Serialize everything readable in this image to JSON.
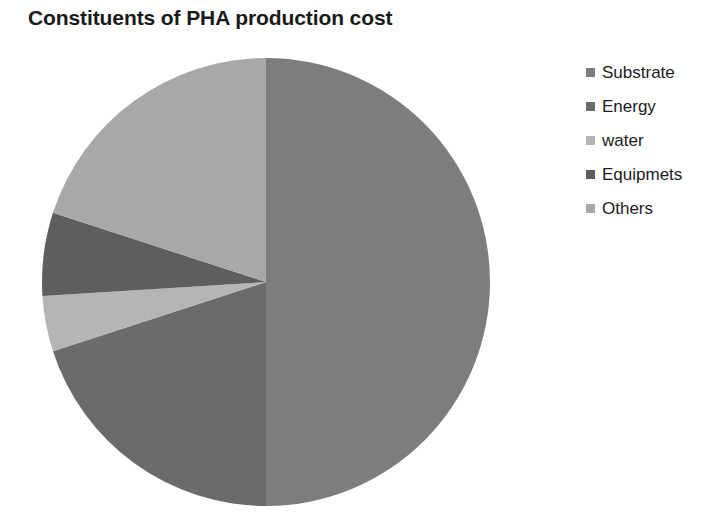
{
  "chart_data": {
    "type": "pie",
    "title": "Constituents of PHA production cost",
    "categories": [
      "Substrate",
      "Energy",
      "water",
      "Equipmets",
      "Others"
    ],
    "values": [
      50,
      20,
      4,
      6,
      20
    ],
    "unit": "%",
    "colors": [
      "#7d7d7d",
      "#6b6b6b",
      "#b5b5b5",
      "#5e5e5e",
      "#a8a8a8"
    ],
    "start_angle_deg": 0,
    "direction": "clockwise",
    "legend_position": "right",
    "data_labels_shown": false,
    "grid": false,
    "slices": [
      {
        "label": "Substrate",
        "value": 50,
        "color": "#7d7d7d",
        "start_deg": 0,
        "end_deg": 180
      },
      {
        "label": "Energy",
        "value": 20,
        "color": "#6b6b6b",
        "start_deg": 180,
        "end_deg": 252
      },
      {
        "label": "water",
        "value": 4,
        "color": "#b5b5b5",
        "start_deg": 252,
        "end_deg": 266.4
      },
      {
        "label": "Equipmets",
        "value": 6,
        "color": "#5e5e5e",
        "start_deg": 266.4,
        "end_deg": 288
      },
      {
        "label": "Others",
        "value": 20,
        "color": "#a8a8a8",
        "start_deg": 288,
        "end_deg": 360
      }
    ],
    "geometry": {
      "center_x": 266,
      "center_y": 282,
      "radius": 224
    }
  },
  "legend": {
    "items": [
      {
        "label": "Substrate",
        "color": "#7d7d7d"
      },
      {
        "label": "Energy",
        "color": "#6b6b6b"
      },
      {
        "label": "water",
        "color": "#b5b5b5"
      },
      {
        "label": "Equipmets",
        "color": "#5e5e5e"
      },
      {
        "label": "Others",
        "color": "#a8a8a8"
      }
    ]
  }
}
